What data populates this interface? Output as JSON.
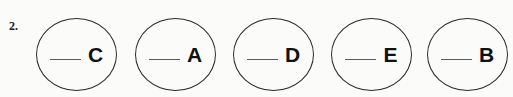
{
  "page": {
    "background_color": "#fbfbf9",
    "ink_color": "#1a1a1a"
  },
  "item": {
    "number_label": "2.",
    "blank_symbol": "___"
  },
  "circles": [
    {
      "blank": "___",
      "letter": "C"
    },
    {
      "blank": "___",
      "letter": "A"
    },
    {
      "blank": "___",
      "letter": "D"
    },
    {
      "blank": "___",
      "letter": "E"
    },
    {
      "blank": "___",
      "letter": "B"
    }
  ]
}
